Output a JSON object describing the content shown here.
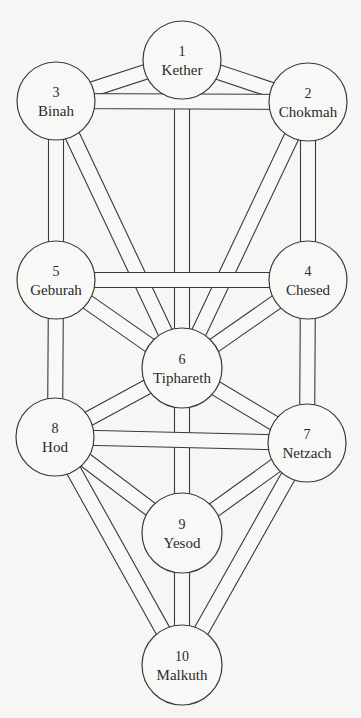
{
  "diagram": {
    "type": "tree-of-life",
    "colors": {
      "background": "#f6f6f4",
      "fill": "#f8f8f6",
      "stroke": "#3a3a3a",
      "text": "#2a2a2a"
    },
    "path_width": 15,
    "sephiroth": [
      {
        "id": "kether",
        "number": "1",
        "name": "Kether",
        "cx": 182,
        "cy": 60,
        "r": 39
      },
      {
        "id": "chokmah",
        "number": "2",
        "name": "Chokmah",
        "cx": 308,
        "cy": 102,
        "r": 39
      },
      {
        "id": "binah",
        "number": "3",
        "name": "Binah",
        "cx": 56,
        "cy": 101,
        "r": 39
      },
      {
        "id": "chesed",
        "number": "4",
        "name": "Chesed",
        "cx": 308,
        "cy": 280,
        "r": 39
      },
      {
        "id": "geburah",
        "number": "5",
        "name": "Geburah",
        "cx": 56,
        "cy": 280,
        "r": 39
      },
      {
        "id": "tiphareth",
        "number": "6",
        "name": "Tiphareth",
        "cx": 182,
        "cy": 368,
        "r": 40
      },
      {
        "id": "netzach",
        "number": "7",
        "name": "Netzach",
        "cx": 307,
        "cy": 443,
        "r": 39
      },
      {
        "id": "hod",
        "number": "8",
        "name": "Hod",
        "cx": 55,
        "cy": 437,
        "r": 39
      },
      {
        "id": "yesod",
        "number": "9",
        "name": "Yesod",
        "cx": 182,
        "cy": 533,
        "r": 40
      },
      {
        "id": "malkuth",
        "number": "10",
        "name": "Malkuth",
        "cx": 182,
        "cy": 665,
        "r": 40
      }
    ],
    "paths_under": [
      [
        "kether",
        "chokmah"
      ],
      [
        "kether",
        "binah"
      ],
      [
        "kether",
        "tiphareth"
      ],
      [
        "chokmah",
        "tiphareth"
      ],
      [
        "chokmah",
        "chesed"
      ],
      [
        "binah",
        "tiphareth"
      ],
      [
        "binah",
        "geburah"
      ],
      [
        "chesed",
        "tiphareth"
      ],
      [
        "chesed",
        "netzach"
      ],
      [
        "geburah",
        "tiphareth"
      ],
      [
        "geburah",
        "hod"
      ],
      [
        "tiphareth",
        "netzach"
      ],
      [
        "tiphareth",
        "hod"
      ],
      [
        "tiphareth",
        "yesod"
      ],
      [
        "netzach",
        "yesod"
      ],
      [
        "netzach",
        "malkuth"
      ],
      [
        "hod",
        "yesod"
      ],
      [
        "hod",
        "malkuth"
      ],
      [
        "yesod",
        "malkuth"
      ]
    ],
    "paths_over": [
      [
        "binah",
        "chokmah"
      ],
      [
        "geburah",
        "chesed"
      ],
      [
        "hod",
        "netzach"
      ]
    ]
  }
}
